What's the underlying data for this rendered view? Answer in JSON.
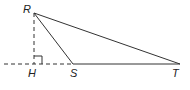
{
  "diagram": {
    "type": "geometry-triangle",
    "points": {
      "R": {
        "label": "R",
        "x": 34,
        "y": 13
      },
      "H": {
        "label": "H",
        "x": 34,
        "y": 64
      },
      "S": {
        "label": "S",
        "x": 73,
        "y": 64
      },
      "T": {
        "label": "T",
        "x": 180,
        "y": 64
      }
    },
    "segments": [
      {
        "from": "R",
        "to": "S",
        "style": "solid"
      },
      {
        "from": "R",
        "to": "T",
        "style": "solid"
      },
      {
        "from": "S",
        "to": "T",
        "style": "solid"
      },
      {
        "from": "R",
        "to": "H",
        "style": "dashed"
      },
      {
        "from": "line-start",
        "to": "S",
        "style": "dashed"
      }
    ],
    "right_angle_at": "H",
    "colors": {
      "stroke": "#333333",
      "background": "#ffffff"
    }
  }
}
